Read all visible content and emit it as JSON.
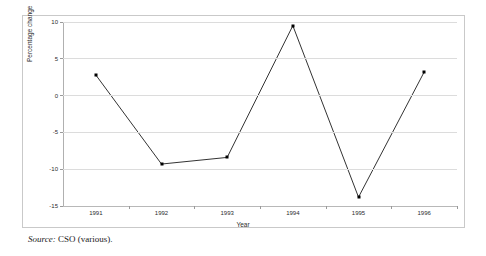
{
  "chart_data": {
    "type": "line",
    "title": "",
    "subtitle": "",
    "xlabel": "Year",
    "ylabel": "Percentage change",
    "categories": [
      "1991",
      "1992",
      "1993",
      "1994",
      "1995",
      "1996"
    ],
    "values": [
      2.8,
      -9.3,
      -8.4,
      9.5,
      -13.8,
      3.2
    ],
    "series": [
      {
        "name": "Percentage change",
        "values": [
          2.8,
          -9.3,
          -8.4,
          9.5,
          -13.8,
          3.2
        ]
      }
    ],
    "ylim": [
      -15,
      10
    ],
    "yticks": [
      10,
      5,
      0,
      -5,
      -10,
      -15
    ],
    "ytick_labels": [
      "10",
      "5",
      "0",
      "-5",
      "-10",
      "-15"
    ],
    "xtick_labels": [
      "1991",
      "1992",
      "1993",
      "1994",
      "1995",
      "1996"
    ],
    "grid": true,
    "grid_axis": "y",
    "legend": false,
    "legend_position": "none",
    "marker": "square",
    "line_color": "#333333",
    "marker_color": "#000000",
    "grid_color": "#dcdcdc",
    "background_color": "#ffffff"
  },
  "caption": {
    "source_label": "Source:",
    "source_text": "CSO (various)."
  }
}
